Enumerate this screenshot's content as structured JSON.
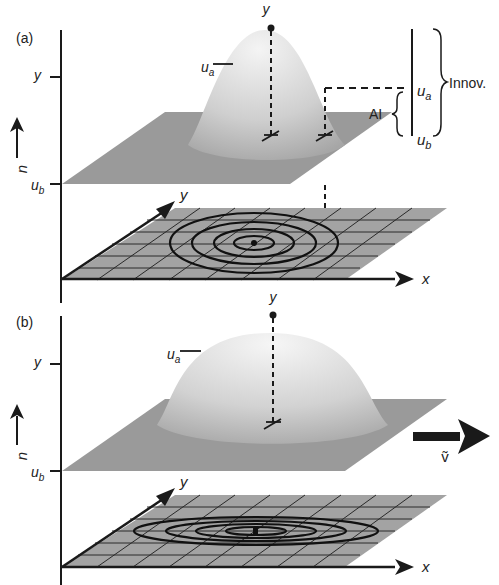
{
  "panels": [
    {
      "id": "a",
      "label": "(a)",
      "axis_u": "u",
      "tick_y": "y",
      "tick_ub": "u",
      "tick_ub_sub": "b",
      "ua": "u",
      "ua_sub": "a",
      "obs": "y",
      "x_axis": "x",
      "y_axis": "y",
      "right_ua": "u",
      "right_ua_sub": "a",
      "right_ub": "u",
      "right_ub_sub": "b",
      "ai_label": "AI",
      "innov_label": "Innov."
    },
    {
      "id": "b",
      "label": "(b)",
      "axis_u": "u",
      "tick_y": "y",
      "tick_ub": "u",
      "tick_ub_sub": "b",
      "ua": "u",
      "ua_sub": "a",
      "obs": "y",
      "x_axis": "x",
      "y_axis": "y",
      "wind_label": "ṽ"
    }
  ],
  "colors": {
    "plane": "#9a9a9a",
    "grid_plane": "#a3a3a3",
    "line": "#1a1a1a",
    "hump_light": "#f2f2f2",
    "hump_dark": "#a8a8a8"
  }
}
